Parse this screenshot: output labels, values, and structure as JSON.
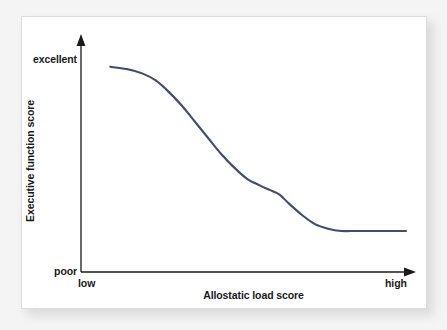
{
  "figure": {
    "card_background": "#ffffff",
    "page_background": "#f4f4f4",
    "border_color": "#dcdcdc"
  },
  "axes": {
    "y_axis_title": "Executive function score",
    "y_top_label": "excellent",
    "y_bottom_label": "poor",
    "x_axis_title": "Allostatic load score",
    "x_left_label": "low",
    "x_right_label": "high",
    "axis_color": "#1a1a1a"
  },
  "chart_data": {
    "type": "line",
    "title": "",
    "xlabel": "Allostatic load score",
    "ylabel": "Executive function score",
    "xlim": [
      0,
      100
    ],
    "ylim": [
      0,
      100
    ],
    "grid": false,
    "legend": null,
    "x_tick_labels": [
      "low",
      "high"
    ],
    "y_tick_labels": [
      "poor",
      "excellent"
    ],
    "annotations": [],
    "series": [
      {
        "name": "Executive function vs allostatic load",
        "color": "#3e4d70",
        "line_width": 2.1,
        "description": "Sigmoid decline: high plateau at low allostatic load, steep drop through mid-range, low plateau at high load",
        "x": [
          9,
          14,
          19,
          23,
          27,
          31,
          35,
          39,
          43,
          47,
          51,
          55,
          58,
          61,
          64,
          68,
          72,
          76,
          80,
          85,
          90,
          95,
          100
        ],
        "y": [
          90,
          89,
          87,
          84,
          79,
          73,
          66,
          59,
          52,
          46,
          41,
          38,
          36,
          34,
          30,
          25,
          21,
          19,
          18,
          18,
          18,
          18,
          18
        ]
      }
    ]
  }
}
